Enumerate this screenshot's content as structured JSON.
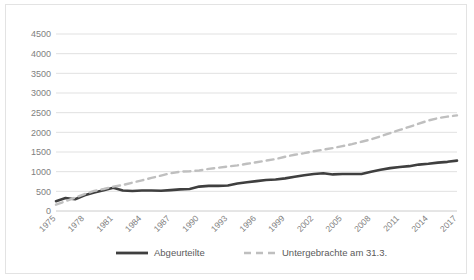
{
  "chart_data": {
    "type": "line",
    "title": "",
    "subtitle": "",
    "xlabel": "",
    "ylabel": "",
    "ylim": [
      0,
      4500
    ],
    "ytick_step": 500,
    "yticks": [
      0,
      500,
      1000,
      1500,
      2000,
      2500,
      3000,
      3500,
      4000,
      4500
    ],
    "ytick_labels": [
      "0",
      "500",
      "1000",
      "1500",
      "2000",
      "2500",
      "3000",
      "3500",
      "4000",
      "4500"
    ],
    "grid": true,
    "grid_axis": "y",
    "legend_position": "bottom-center",
    "xtick_rotation": -45,
    "x": [
      1975,
      1976,
      1977,
      1978,
      1979,
      1980,
      1981,
      1982,
      1983,
      1984,
      1985,
      1986,
      1987,
      1988,
      1989,
      1990,
      1991,
      1992,
      1993,
      1994,
      1995,
      1996,
      1997,
      1998,
      1999,
      2000,
      2001,
      2002,
      2003,
      2004,
      2005,
      2006,
      2007,
      2008,
      2009,
      2010,
      2011,
      2012,
      2013,
      2014,
      2015,
      2016,
      2017
    ],
    "xtick_labels": [
      "1975",
      "1978",
      "1981",
      "1984",
      "1987",
      "1990",
      "1993",
      "1996",
      "1999",
      "2002",
      "2005",
      "2008",
      "2011",
      "2014",
      "2017"
    ],
    "xtick_values": [
      1975,
      1978,
      1981,
      1984,
      1987,
      1990,
      1993,
      1996,
      1999,
      2002,
      2005,
      2008,
      2011,
      2014,
      2017
    ],
    "series": [
      {
        "name": "Abgeurteilte",
        "style": "solid",
        "color": "#3f3f3f",
        "width": 2.6,
        "values": [
          250,
          330,
          300,
          400,
          470,
          530,
          590,
          520,
          510,
          520,
          520,
          515,
          530,
          550,
          560,
          620,
          640,
          640,
          650,
          700,
          730,
          760,
          790,
          800,
          830,
          870,
          910,
          940,
          960,
          930,
          940,
          940,
          940,
          1000,
          1050,
          1090,
          1120,
          1140,
          1180,
          1200,
          1230,
          1250,
          1280
        ]
      },
      {
        "name": "Untergebrachte am 31.3.",
        "style": "dashed",
        "color": "#bfbfbf",
        "width": 2.4,
        "values": [
          160,
          250,
          340,
          430,
          510,
          560,
          620,
          660,
          720,
          780,
          840,
          900,
          960,
          1000,
          1010,
          1030,
          1070,
          1100,
          1130,
          1160,
          1200,
          1240,
          1280,
          1320,
          1380,
          1430,
          1470,
          1520,
          1560,
          1600,
          1650,
          1700,
          1760,
          1820,
          1900,
          1980,
          2060,
          2140,
          2220,
          2300,
          2360,
          2400,
          2430
        ]
      }
    ],
    "series_abgeurteilte": [
      250,
      330,
      300,
      400,
      470,
      530,
      590,
      520,
      510,
      520,
      520,
      515,
      530,
      550,
      560,
      620,
      640,
      640,
      650,
      700,
      730,
      760,
      790,
      800,
      830,
      870,
      910,
      940,
      960,
      930,
      940,
      940,
      940,
      1000,
      1050,
      1090,
      1120,
      1140,
      1180,
      1200,
      1230,
      1250,
      1280
    ],
    "series_untergebrachte": [
      160,
      250,
      340,
      430,
      510,
      560,
      620,
      660,
      720,
      780,
      840,
      900,
      960,
      1000,
      1010,
      1030,
      1070,
      1100,
      1130,
      1160,
      1200,
      1240,
      1280,
      1320,
      1380,
      1430,
      1470,
      1520,
      1560,
      1600,
      1650,
      1700,
      1760,
      1820,
      1900,
      1980,
      2060,
      2140,
      2220,
      2300,
      2360,
      2400,
      2430
    ]
  },
  "legend": {
    "items": [
      {
        "label": "Abgeurteilte",
        "style": "solid",
        "color": "#3f3f3f"
      },
      {
        "label": "Untergebrachte am 31.3.",
        "style": "dashed",
        "color": "#bfbfbf"
      }
    ]
  },
  "colors": {
    "series_solid": "#3f3f3f",
    "series_dashed": "#bfbfbf",
    "gridline": "#d9d9d9",
    "axis": "#bfbfbf",
    "tick_text": "#808080",
    "legend_text": "#5a5a5a",
    "frame": "#e3e3e3",
    "background": "#ffffff"
  }
}
